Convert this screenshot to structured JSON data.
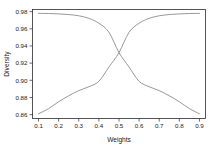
{
  "chart_data": {
    "type": "line",
    "title": "",
    "xlabel": "Weights",
    "ylabel": "Diversity",
    "xlim": [
      0.07,
      0.93
    ],
    "ylim": [
      0.8555,
      0.9825
    ],
    "grid": false,
    "legend": null,
    "xticks": [
      0.1,
      0.2,
      0.3,
      0.4,
      0.5,
      0.6,
      0.7,
      0.8,
      0.9
    ],
    "xtick_labels": [
      "0.1",
      "0.2",
      "0.3",
      "0.4",
      "0.5",
      "0.6",
      "0.7",
      "0.8",
      "0.9"
    ],
    "yticks": [
      0.86,
      0.88,
      0.9,
      0.92,
      0.94,
      0.96,
      0.98
    ],
    "ytick_labels": [
      "0.86",
      "0.88",
      "0.90",
      "0.92",
      "0.94",
      "0.96",
      "0.98"
    ],
    "x": [
      0.1,
      0.15,
      0.2,
      0.25,
      0.3,
      0.35,
      0.4,
      0.45,
      0.5,
      0.55,
      0.6,
      0.65,
      0.7,
      0.75,
      0.8,
      0.85,
      0.9
    ],
    "series": [
      {
        "name": "decreasing",
        "color": "#8c8c8c",
        "values": [
          0.978,
          0.9778,
          0.9774,
          0.9766,
          0.9752,
          0.9722,
          0.9665,
          0.956,
          0.9322,
          0.9155,
          0.8988,
          0.8925,
          0.888,
          0.882,
          0.875,
          0.867,
          0.861
        ]
      },
      {
        "name": "increasing",
        "color": "#8c8c8c",
        "values": [
          0.861,
          0.867,
          0.875,
          0.882,
          0.888,
          0.8925,
          0.8988,
          0.9155,
          0.9322,
          0.956,
          0.9665,
          0.9722,
          0.9752,
          0.9766,
          0.9774,
          0.9778,
          0.978
        ]
      }
    ],
    "crossing_point": {
      "x": 0.5,
      "y": 0.9322
    }
  },
  "axes": {
    "x_title": "Weights",
    "y_title": "Diversity"
  }
}
